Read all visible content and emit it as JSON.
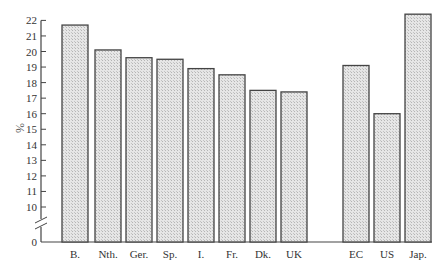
{
  "chart_data": {
    "type": "bar",
    "title": "",
    "xlabel": "",
    "ylabel": "%",
    "ylim": [
      0,
      22
    ],
    "axis_break": {
      "between": [
        0,
        10
      ]
    },
    "yticks": [
      0,
      10,
      11,
      12,
      13,
      14,
      15,
      16,
      17,
      18,
      19,
      20,
      21,
      22
    ],
    "grid": false,
    "legend": null,
    "categories": [
      "B.",
      "Nth.",
      "Ger.",
      "Sp.",
      "I.",
      "Fr.",
      "Dk.",
      "UK",
      "EC",
      "US",
      "Jap."
    ],
    "values": [
      21.7,
      20.1,
      19.6,
      19.5,
      18.9,
      18.5,
      17.5,
      17.4,
      19.1,
      16.0,
      22.4
    ],
    "groups": [
      {
        "name": "EC members",
        "categories": [
          "B.",
          "Nth.",
          "Ger.",
          "Sp.",
          "I.",
          "Fr.",
          "Dk.",
          "UK"
        ]
      },
      {
        "name": "Comparison",
        "categories": [
          "EC",
          "US",
          "Jap."
        ]
      }
    ],
    "bar_fill": "#d9d9d9",
    "bar_stroke": "#444444"
  }
}
